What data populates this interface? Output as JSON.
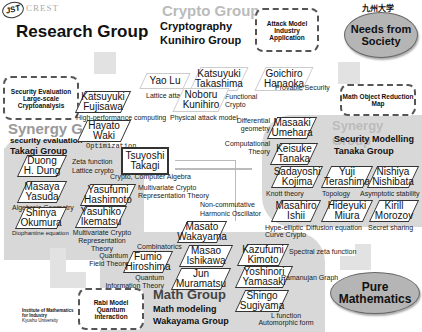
{
  "header": {
    "logo_left": "JST",
    "logo_text": "CREST",
    "logo_right": "九州大学",
    "title": "Research Group"
  },
  "crypto_group": {
    "ghost": "Crypto Group",
    "sub1": "Cryptography",
    "sub2": "Kunihiro Group"
  },
  "synergy_left": {
    "ghost": "Synergy Group",
    "sub1": "security evaluation",
    "sub2": "Takagi Group"
  },
  "synergy_right": {
    "ghost": "Synergy Group",
    "sub1": "Security Modelling",
    "sub2": "Tanaka Group"
  },
  "math_group": {
    "ghost": "Math Group",
    "sub1": "Math modeling",
    "sub2": "Wakayama Group"
  },
  "dashed_boxes": {
    "attack": "Attack Model Industry Application",
    "security_eval": "Security Evaluation Large-scale Cryptoanalysis",
    "math_object": "Math Object Reduction Map",
    "rabi": "Rabi Model Quantum interaction"
  },
  "ellipses": {
    "needs": "Needs from Society",
    "pure": "Pure Mathematics"
  },
  "institute": {
    "line1": "Institute of Mathematics",
    "line2": "for Industry",
    "line3": "Kyushu University"
  },
  "members": [
    {
      "id": "yao",
      "first": "Yao Lu",
      "last": "",
      "topic": "Lattice attack"
    },
    {
      "id": "katsuyuki-t",
      "first": "Katsuyuki",
      "last": "Takashima",
      "topic": "Functional Crypto"
    },
    {
      "id": "goichiro",
      "first": "Goichiro",
      "last": "Hanaoka",
      "topic": "Provable Security"
    },
    {
      "id": "noboru",
      "first": "Noboru",
      "last": "Kunihiro",
      "topic": "Physical attack model"
    },
    {
      "id": "katsuyuki-f",
      "first": "Katsuyuki",
      "last": "Fujisawa",
      "topic": "High-performance computing"
    },
    {
      "id": "hayato",
      "first": "Hayato",
      "last": "Waki",
      "topic": "Optimization"
    },
    {
      "id": "tsuyoshi",
      "first": "Tsuyoshi",
      "last": "Takagi",
      "topic": "Crypto, Computer Algebra"
    },
    {
      "id": "duong",
      "first": "Duong",
      "last": "H. Dung",
      "topic": "Zeta function Lattice crypto"
    },
    {
      "id": "masaya",
      "first": "Masaya",
      "last": "Yasuda",
      "topic": "Algebraic Geometry"
    },
    {
      "id": "yasufumi",
      "first": "Yasufumi",
      "last": "Hashimoto",
      "topic": "Multivariate Crypto Representation Theory"
    },
    {
      "id": "shinya",
      "first": "Shinya",
      "last": "Okumura",
      "topic": "Diophantine equation"
    },
    {
      "id": "yasuhiko",
      "first": "Yasuhiko",
      "last": "Ikematsu",
      "topic": "Multivariate Crypto Representation Theory"
    },
    {
      "id": "masaaki",
      "first": "Masaaki",
      "last": "Umehara",
      "topic": "Differential geometry"
    },
    {
      "id": "keisuke",
      "first": "Keisuke",
      "last": "Tanaka",
      "topic": "Computational Theory"
    },
    {
      "id": "sadayoshi",
      "first": "Sadayoshi",
      "last": "Kojima",
      "topic": "Knott theory"
    },
    {
      "id": "yuji",
      "first": "Yuji",
      "last": "Terashima",
      "topic": "Topology"
    },
    {
      "id": "nishiya",
      "first": "Nishiya",
      "last": "Nishibata",
      "topic": "Asymptotic stability"
    },
    {
      "id": "masahiro",
      "first": "Masahiro",
      "last": "Ishii",
      "topic": "Hype-elliptic Curve Crypto"
    },
    {
      "id": "hideyuki",
      "first": "Hideyuki",
      "last": "Miura",
      "topic": "Diffusion equation"
    },
    {
      "id": "kirill",
      "first": "Kirill",
      "last": "Morozov",
      "topic": "Secret sharing"
    },
    {
      "id": "masato",
      "first": "Masato",
      "last": "Wakayama",
      "topic": "Non-commutative Harmonic Oscillator"
    },
    {
      "id": "fumio",
      "first": "Fumio",
      "last": "Hiroshima",
      "topic": "Quantum Field Theory"
    },
    {
      "id": "masao",
      "first": "Masao",
      "last": "Ishikawa",
      "topic": "Combinatorics"
    },
    {
      "id": "kazufumi",
      "first": "Kazufumi",
      "last": "Kimoto",
      "topic": "Spectral zeta function"
    },
    {
      "id": "jun",
      "first": "Jun",
      "last": "Muramatsu",
      "topic": "Quantum Information Theory"
    },
    {
      "id": "yoshinori",
      "first": "Yoshinori",
      "last": "Yamasaki",
      "topic": "Ramanujan Graph"
    },
    {
      "id": "shingo",
      "first": "Shingo",
      "last": "Sugiyama",
      "topic": "L function Automorphic form"
    }
  ],
  "colors": {
    "region_gray": "#d8d8d8",
    "ellipse_gray": "#b5b5b5",
    "border_dark": "#333333",
    "ghost_text": "#bbbbbb"
  }
}
